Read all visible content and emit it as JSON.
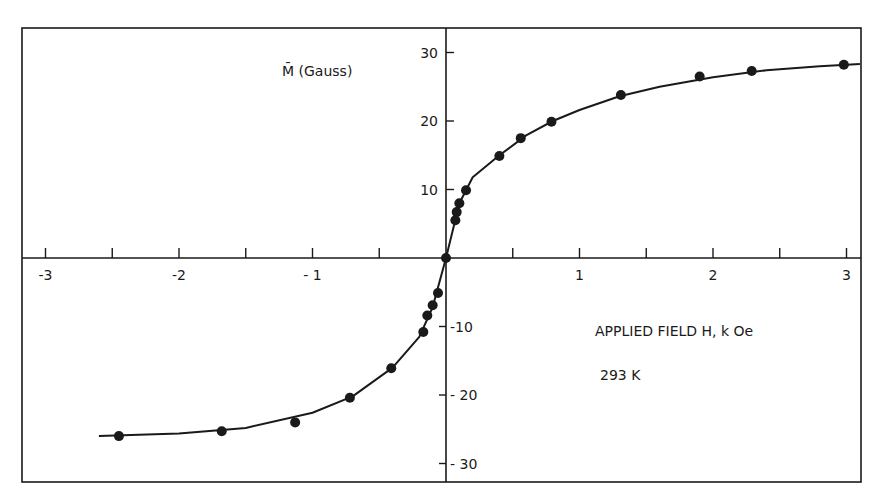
{
  "chart_data": {
    "type": "scatter",
    "title": "",
    "xlabel": "APPLIED FIELD H, k Oe",
    "ylabel": "M̄ (Gauss)",
    "annotation": "293 K",
    "xlim": [
      -3.15,
      3.1
    ],
    "ylim": [
      -33,
      34
    ],
    "x_ticks": [
      -3,
      -2,
      -1,
      1,
      2,
      3
    ],
    "x_tick_labels": [
      "-3",
      "-2",
      "- 1",
      "1",
      "2",
      "3"
    ],
    "x_minor_ticks": [
      -3,
      -2.5,
      -2,
      -1.5,
      -1,
      -0.5,
      0.5,
      1,
      1.5,
      2,
      2.5,
      3
    ],
    "y_ticks": [
      30,
      20,
      10,
      -10,
      -20,
      -30
    ],
    "y_tick_labels": [
      "30",
      "20",
      "10",
      "-10",
      "- 20",
      "- 30"
    ],
    "grid": false,
    "legend": null,
    "series": [
      {
        "name": "measured",
        "style": "markers",
        "x": [
          -2.45,
          -1.68,
          -1.13,
          -0.72,
          -0.41,
          -0.17,
          -0.14,
          -0.1,
          -0.06,
          0.0,
          0.07,
          0.08,
          0.1,
          0.15,
          0.4,
          0.56,
          0.79,
          1.31,
          1.9,
          2.29,
          2.98
        ],
        "y": [
          -26.0,
          -25.3,
          -24.0,
          -20.4,
          -16.1,
          -10.8,
          -8.4,
          -6.9,
          -5.1,
          0.0,
          5.5,
          6.7,
          8.0,
          9.9,
          14.9,
          17.5,
          19.9,
          23.8,
          26.5,
          27.3,
          28.2
        ]
      },
      {
        "name": "fit curve",
        "style": "line",
        "x": [
          -2.6,
          -2.0,
          -1.5,
          -1.0,
          -0.7,
          -0.4,
          -0.2,
          -0.1,
          0.0,
          0.1,
          0.2,
          0.4,
          0.6,
          0.8,
          1.0,
          1.3,
          1.6,
          2.0,
          2.4,
          2.8,
          3.1
        ],
        "y": [
          -26.0,
          -25.6,
          -24.8,
          -22.6,
          -20.2,
          -16.0,
          -11.5,
          -7.2,
          0.0,
          8.0,
          11.8,
          15.0,
          17.9,
          20.0,
          21.6,
          23.6,
          25.0,
          26.4,
          27.4,
          28.0,
          28.3
        ]
      }
    ]
  },
  "labels": {
    "y_axis_title": "M̄ (Gauss)",
    "x_axis_title": "APPLIED FIELD H, k Oe",
    "temperature": "293 K"
  }
}
